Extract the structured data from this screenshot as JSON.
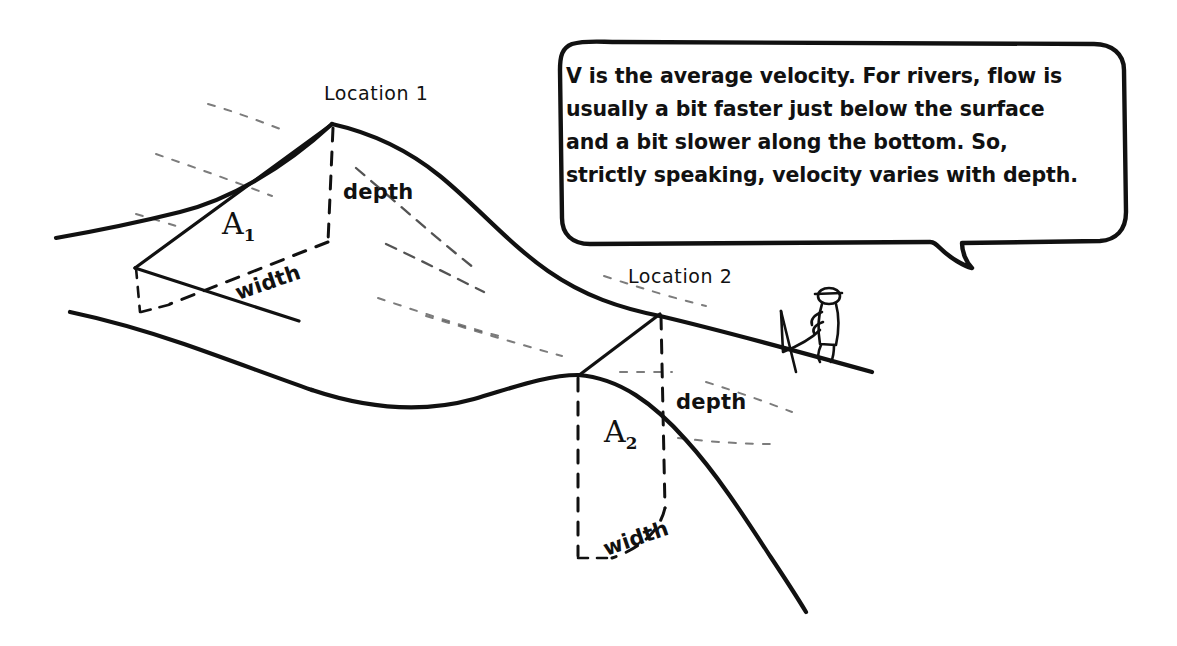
{
  "diagram": {
    "speech_bubble": {
      "name": "velocity-explanation",
      "lines": [
        "V is the average velocity. For rivers, flow is",
        "usually a bit faster just below the surface",
        "and a bit slower along the bottom. So,",
        "strictly speaking, velocity varies with depth."
      ]
    },
    "locations": [
      {
        "id": "location-1",
        "label": "Location 1",
        "area_symbol": "A",
        "area_subscript": "1",
        "depth_label": "depth",
        "width_label": "width"
      },
      {
        "id": "location-2",
        "label": "Location 2",
        "area_symbol": "A",
        "area_subscript": "2",
        "depth_label": "depth",
        "width_label": "width"
      }
    ],
    "figure": {
      "name": "observer-with-flag",
      "description": "stick figure holding a flag on the riverbank"
    },
    "colors": {
      "ink": "#111111",
      "background": "#ffffff"
    }
  }
}
